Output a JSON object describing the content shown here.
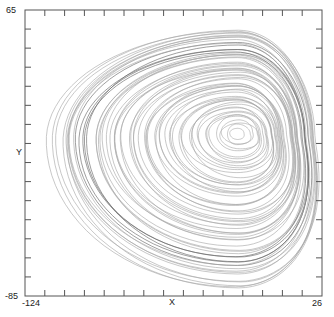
{
  "chart_data": {
    "type": "line",
    "title": "",
    "xlabel": "X",
    "ylabel": "Y",
    "xlim": [
      -124,
      26
    ],
    "ylim": [
      -85,
      65
    ],
    "x_tick_labels": [
      "-124",
      "26"
    ],
    "y_tick_labels": [
      "65",
      "-85"
    ],
    "grid": false,
    "legend": null,
    "line_color": "#a8a8a8",
    "frame_color": "#555555",
    "spiral_center": {
      "x": 4,
      "y": 6
    },
    "orbit_extents": {
      "min_x": -114,
      "max_x": 20,
      "min_y": -76,
      "max_y": 52
    }
  },
  "axes": {
    "x_min_label": "-124",
    "x_max_label": "26",
    "y_max_label": "65",
    "y_min_label": "-85",
    "x_axis_label": "X",
    "y_axis_label": "Y"
  }
}
